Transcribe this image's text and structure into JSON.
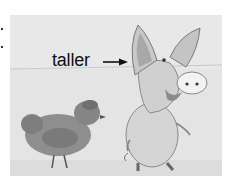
{
  "illustration": {
    "label": "taller",
    "arrow": "right-arrow",
    "subjects": [
      "hen",
      "pig"
    ],
    "colors": {
      "background": "#e2e2e2",
      "hen": "#8c8c8c",
      "pig": "#d6d6d6",
      "outline": "#777777"
    }
  }
}
